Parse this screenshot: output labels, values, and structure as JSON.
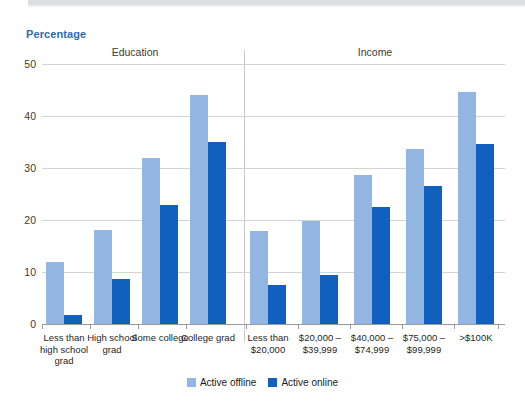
{
  "axis_title": "Percentage",
  "sections": [
    {
      "name": "education-section",
      "label": "Education"
    },
    {
      "name": "income-section",
      "label": "Income"
    }
  ],
  "legend": {
    "position": "bottom-center",
    "items": [
      {
        "label": "Active offline",
        "color": "#93b5e1"
      },
      {
        "label": "Active online",
        "color": "#1160bd"
      }
    ]
  },
  "chart_data": {
    "type": "bar",
    "title": "",
    "subtitle": "",
    "xlabel": "",
    "ylabel": "Percentage",
    "ylim": [
      0,
      50
    ],
    "yticks": [
      0,
      10,
      20,
      30,
      40,
      50
    ],
    "ytick_labels": [
      "0",
      "10",
      "20",
      "30",
      "40",
      "50"
    ],
    "grid": true,
    "grouping": "grouped",
    "panels": [
      "Education",
      "Income"
    ],
    "categories": [
      "Less than\nhigh school\ngrad",
      "High school\ngrad",
      "Some college",
      "College grad",
      "Less than\n$20,000",
      "$20,000 –\n$39,999",
      "$40,000 –\n$74,999",
      "$75,000 –\n$99,999",
      ">$100K"
    ],
    "category_panel": [
      "Education",
      "Education",
      "Education",
      "Education",
      "Income",
      "Income",
      "Income",
      "Income",
      "Income"
    ],
    "series": [
      {
        "name": "Active offline",
        "color": "#93b5e1",
        "values": [
          12.0,
          18.0,
          32.0,
          44.0,
          17.8,
          19.8,
          28.7,
          33.7,
          44.6
        ]
      },
      {
        "name": "Active online",
        "color": "#1160bd",
        "values": [
          1.8,
          8.7,
          22.8,
          35.0,
          7.5,
          9.5,
          22.5,
          26.5,
          34.6
        ]
      }
    ]
  },
  "colors": {
    "accent": "#2c6bb3",
    "offline": "#93b5e1",
    "online": "#1160bd",
    "gridline": "#d3d3d3",
    "axis": "#9a9a9a"
  }
}
